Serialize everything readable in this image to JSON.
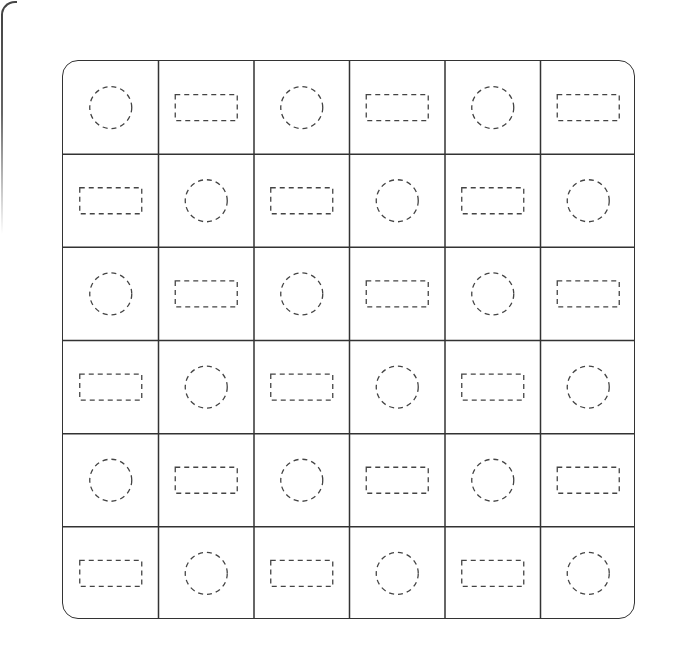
{
  "worksheet": {
    "title": "",
    "rows": 6,
    "cols": 6,
    "colors": {
      "grid_line": "#333333",
      "dash_stroke": "#444444",
      "background": "#ffffff"
    },
    "cells": [
      [
        "circle",
        "rectangle",
        "circle",
        "rectangle",
        "circle",
        "rectangle"
      ],
      [
        "rectangle",
        "circle",
        "rectangle",
        "circle",
        "rectangle",
        "circle"
      ],
      [
        "circle",
        "rectangle",
        "circle",
        "rectangle",
        "circle",
        "rectangle"
      ],
      [
        "rectangle",
        "circle",
        "rectangle",
        "circle",
        "rectangle",
        "circle"
      ],
      [
        "circle",
        "rectangle",
        "circle",
        "rectangle",
        "circle",
        "rectangle"
      ],
      [
        "rectangle",
        "circle",
        "rectangle",
        "circle",
        "rectangle",
        "circle"
      ]
    ]
  }
}
